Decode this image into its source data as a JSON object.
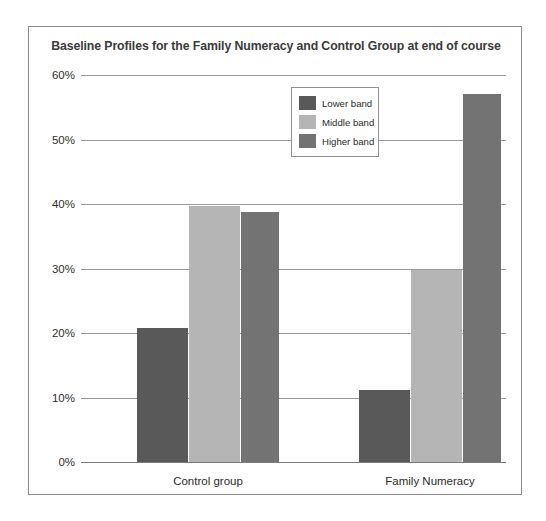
{
  "chart_data": {
    "type": "bar",
    "title": "Baseline Profiles for the Family Numeracy and Control Group at end of course",
    "xlabel": "",
    "ylabel": "",
    "categories": [
      "Control group",
      "Family Numeracy"
    ],
    "series": [
      {
        "name": "Lower band",
        "color": "#595959",
        "values": [
          20.8,
          11.2
        ]
      },
      {
        "name": "Middle band",
        "color": "#b5b5b5",
        "values": [
          39.7,
          29.7
        ]
      },
      {
        "name": "Higher band",
        "color": "#737373",
        "values": [
          38.7,
          57.0
        ]
      }
    ],
    "ylim": [
      0,
      60
    ],
    "ytick_labels": [
      "60%",
      "50%",
      "40%",
      "30%",
      "20%",
      "10%",
      "0%"
    ],
    "ytick_values": [
      60,
      50,
      40,
      30,
      20,
      10,
      0
    ],
    "grid": true,
    "legend_position": "upper-center"
  }
}
